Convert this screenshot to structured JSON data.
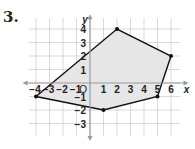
{
  "problem_number": "3.",
  "graph": {
    "x_axis_label": "x",
    "y_axis_label": "y",
    "origin_label": "O",
    "x_range": [
      -4,
      6
    ],
    "y_range": [
      -3,
      4
    ],
    "x_ticks": [
      "-4",
      "-3",
      "-2",
      "-1",
      "1",
      "2",
      "3",
      "4",
      "5",
      "6"
    ],
    "y_ticks": [
      "4",
      "3",
      "2",
      "1",
      "-1",
      "-2",
      "-3"
    ],
    "polygon_vertices": [
      [
        -4,
        -1
      ],
      [
        2,
        4
      ],
      [
        6,
        2
      ],
      [
        5,
        -1
      ],
      [
        1,
        -2
      ]
    ],
    "fill_color": "#e6e6e6",
    "edge_color": "#111111",
    "grid_color": "#cfcfcf",
    "axis_color": "#9a9a9a"
  }
}
